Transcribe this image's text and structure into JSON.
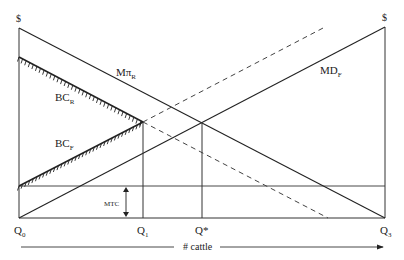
{
  "diagram": {
    "axes": {
      "left_axis_label": "$",
      "right_axis_label": "$",
      "x_axis_label": "# cattle"
    },
    "quantity_labels": {
      "q0": {
        "main": "Q",
        "sub": "0"
      },
      "q1": {
        "main": "Q",
        "sub": "1"
      },
      "q_star": {
        "main": "Q*"
      },
      "q3": {
        "main": "Q",
        "sub": "3"
      }
    },
    "curves": {
      "marginal_profit_rancher": {
        "main": "Mπ",
        "sub": "R"
      },
      "marginal_damage_farmer": {
        "main": "MD",
        "sub": "F"
      },
      "bargaining_cost_rancher": {
        "main": "BC",
        "sub": "R"
      },
      "bargaining_cost_farmer": {
        "main": "BC",
        "sub": "F"
      }
    },
    "annotations": {
      "mtc": "MTC"
    },
    "colors": {
      "line": "#222222",
      "background": "#ffffff"
    }
  }
}
